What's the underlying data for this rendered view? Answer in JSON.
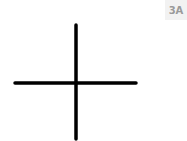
{
  "label": {
    "text": "3A",
    "background": "#f2f2f2",
    "color": "#9a9a9a"
  },
  "figure": {
    "shape": "plus-cross",
    "stroke_color": "#000000",
    "vertical": {
      "x": 76,
      "y1": 25,
      "y2": 139
    },
    "horizontal": {
      "y": 83,
      "x1": 15,
      "x2": 136
    },
    "stroke_width": 3.5
  }
}
